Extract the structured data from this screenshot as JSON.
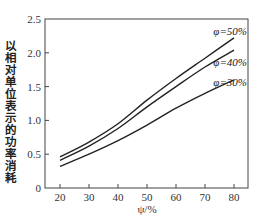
{
  "chart_data": {
    "type": "line",
    "title": "",
    "xlabel": "ψ/%",
    "ylabel": "以相对单位表示的功率消耗",
    "xlim": [
      10,
      85
    ],
    "ylim": [
      0,
      2.5
    ],
    "grid": false,
    "legend_position": "inline-right",
    "x_ticks": [
      20,
      30,
      40,
      50,
      60,
      70,
      80
    ],
    "y_ticks": [
      0,
      0.5,
      1.0,
      1.5,
      2.0,
      2.5
    ],
    "y_tick_labels": [
      "0",
      "0.5",
      "1.0",
      "1.5",
      "2.0",
      "2.5"
    ],
    "x": [
      20,
      30,
      40,
      50,
      60,
      70,
      80
    ],
    "series": [
      {
        "name": "φ=50%",
        "values": [
          0.46,
          0.68,
          0.95,
          1.3,
          1.62,
          1.92,
          2.22
        ]
      },
      {
        "name": "φ=40%",
        "values": [
          0.41,
          0.62,
          0.88,
          1.2,
          1.5,
          1.79,
          2.04
        ]
      },
      {
        "name": "φ=30%",
        "values": [
          0.32,
          0.5,
          0.7,
          0.93,
          1.18,
          1.4,
          1.6
        ]
      }
    ]
  },
  "labels": {
    "ylabel": "以相对单位表示的功率消耗",
    "xlabel": "ψ/%",
    "legend_50": "φ=50%",
    "legend_40": "φ=40%",
    "legend_30": "φ=30%"
  }
}
